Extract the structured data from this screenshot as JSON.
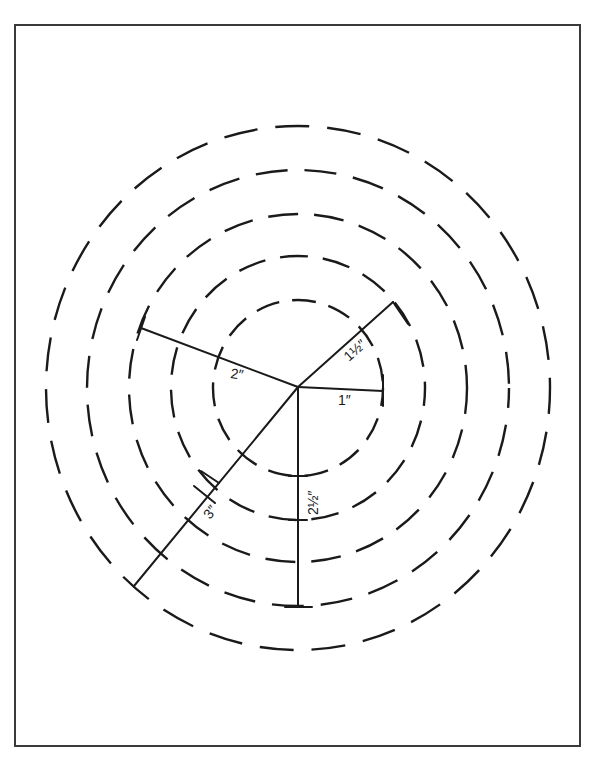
{
  "figure": {
    "labels": {
      "r1": "1″",
      "r1_5": "1½″",
      "r2": "2″",
      "r2_5": "2½″",
      "r3": "3″"
    },
    "rings": [
      {
        "name": "ring-1in",
        "radius_label": "1″"
      },
      {
        "name": "ring-1-5in",
        "radius_label": "1½″"
      },
      {
        "name": "ring-2in",
        "radius_label": "2″"
      },
      {
        "name": "ring-2-5in",
        "radius_label": "2½″"
      },
      {
        "name": "ring-3in",
        "radius_label": "3″"
      }
    ],
    "colors": {
      "line": "#1a1a1a",
      "frame": "#3a3a3a",
      "background": "#ffffff"
    }
  },
  "caption": {
    "text": ""
  }
}
